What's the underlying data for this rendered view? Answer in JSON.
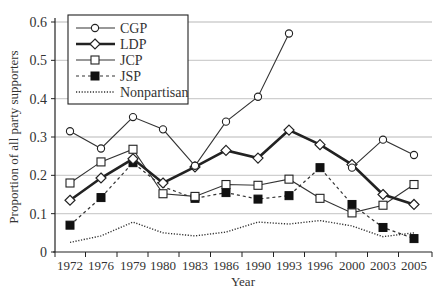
{
  "chart_data": {
    "type": "line",
    "title": "",
    "xlabel": "Year",
    "ylabel": "Proportion of all party supporters",
    "ylim": [
      0,
      0.6
    ],
    "yticks": [
      0,
      0.1,
      0.2,
      0.3,
      0.4,
      0.5,
      0.6
    ],
    "ytick_labels": [
      "0",
      "0.1",
      "0.2",
      "0.3",
      "0.4",
      "0.5",
      "0.6"
    ],
    "categories": [
      "1972",
      "1976",
      "1979",
      "1980",
      "1983",
      "1986",
      "1990",
      "1993",
      "1996",
      "2000",
      "2003",
      "2005"
    ],
    "grid": "horizontal",
    "legend_position": "upper-left",
    "series": [
      {
        "name": "CGP",
        "style": "solid-thin",
        "marker": "circle-open",
        "values": [
          0.315,
          0.27,
          0.352,
          0.32,
          0.225,
          0.34,
          0.405,
          0.57,
          null,
          0.22,
          0.293,
          0.253
        ]
      },
      {
        "name": "LDP",
        "style": "solid-thick",
        "marker": "diamond-open",
        "values": [
          0.135,
          0.193,
          0.243,
          0.18,
          0.222,
          0.265,
          0.245,
          0.318,
          0.28,
          0.228,
          0.15,
          0.124
        ]
      },
      {
        "name": "JCP",
        "style": "solid-thin",
        "marker": "square-open",
        "values": [
          0.18,
          0.235,
          0.268,
          0.152,
          0.145,
          0.176,
          0.174,
          0.19,
          0.14,
          0.102,
          0.122,
          0.176
        ]
      },
      {
        "name": "JSP",
        "style": "dashed",
        "marker": "square-filled",
        "values": [
          0.07,
          0.142,
          0.233,
          0.17,
          0.14,
          0.155,
          0.138,
          0.147,
          0.22,
          0.124,
          0.064,
          0.035
        ]
      },
      {
        "name": "Nonpartisan",
        "style": "dotted",
        "marker": "none",
        "values": [
          0.025,
          0.042,
          0.078,
          0.05,
          0.042,
          0.052,
          0.078,
          0.073,
          0.082,
          0.068,
          0.04,
          0.05
        ]
      }
    ]
  },
  "legend": {
    "items": [
      {
        "label": "CGP"
      },
      {
        "label": "LDP"
      },
      {
        "label": "JCP"
      },
      {
        "label": "JSP"
      },
      {
        "label": "Nonpartisan"
      }
    ]
  },
  "axes": {
    "xlabel": "Year",
    "ylabel": "Proportion of all party supporters"
  }
}
